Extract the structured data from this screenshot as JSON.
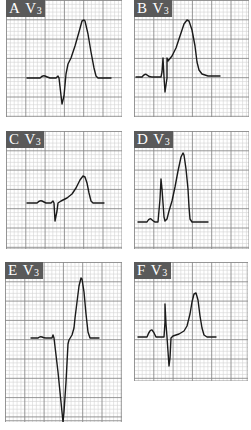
{
  "figure": {
    "colors": {
      "label_bg": "#5a5a5a",
      "label_text": "#ffffff",
      "grid_minor": "#d4d4d4",
      "grid_major": "#8a8a8a",
      "trace": "#1a1a1a"
    },
    "grid": {
      "minor_px": 3.86,
      "major_px": 19.3
    },
    "panels": [
      {
        "id": "A",
        "letter": "A",
        "lead": "V",
        "lead_sub": "3",
        "x": 6,
        "y": 0,
        "w": 116,
        "h": 117,
        "trace": "M 21 78 L 34 78 Q 37 75 39 76 Q 41 77 44 78 L 50 78 L 52 76 L 53 78 L 56 104 L 58 96 L 60 74 L 62 64 L 65 58 L 69 46 L 73 32 L 76 21 L 78 20 L 79 21 L 82 34 L 85 52 L 88 68 L 90 76 L 92 78 L 105 78"
      },
      {
        "id": "B",
        "letter": "B",
        "lead": "V",
        "lead_sub": "3",
        "x": 134,
        "y": 0,
        "w": 115,
        "h": 117,
        "trace": "M 2 77 L 8 77 Q 11 73 13 75 Q 15 77 18 77 L 27 77 L 28 72 L 29 58 L 30 77 L 31 92 L 33 78 L 33 58 L 34 61 L 38 56 L 42 48 L 46 36 L 50 24 L 53 20 L 55 21 L 58 30 L 61 46 L 63 62 L 65 70 L 68 74 L 74 76 L 86 76"
      },
      {
        "id": "C",
        "letter": "C",
        "lead": "V",
        "lead_sub": "3",
        "x": 6,
        "y": 131,
        "w": 116,
        "h": 118,
        "trace": "M 21 72 L 31 72 Q 34 69 36 70 Q 38 71 40 72 L 45 72 L 47 70 L 48 72 L 49 90 L 51 80 L 52 72 L 55 70 L 61 67 L 66 63 L 70 57 L 74 49 L 77 45 L 79 46 L 81 52 L 83 62 L 85 70 L 87 72 L 98 72"
      },
      {
        "id": "D",
        "letter": "D",
        "lead": "V",
        "lead_sub": "3",
        "x": 134,
        "y": 131,
        "w": 115,
        "h": 118,
        "trace": "M 4 91 L 13 91 Q 15 87 17 88 Q 19 90 21 91 L 24 91 L 26 68 L 27 48 L 28 58 L 30 86 L 31 90 L 33 88 L 35 80 L 38 70 L 41 56 L 44 40 L 47 26 L 49 22 L 50 24 L 52 38 L 54 58 L 55 76 L 56 88 L 58 91 L 74 91"
      },
      {
        "id": "E",
        "letter": "E",
        "lead": "V",
        "lead_sub": "3",
        "x": 5,
        "y": 262,
        "w": 117,
        "h": 160,
        "trace": "M 26 76 L 33 76 Q 35 74 37 75 Q 39 76 41 76 L 47 76 L 48 73 L 49 76 L 53 110 L 57 150 L 58 160 L 59 150 L 61 120 L 63 82 L 64 78 L 67 73 L 69 66 L 70 56 L 72 40 L 74 24 L 76 16 L 77 17 L 79 30 L 81 52 L 83 70 L 85 76 L 94 76"
      },
      {
        "id": "F",
        "letter": "F",
        "lead": "V",
        "lead_sub": "3",
        "x": 134,
        "y": 262,
        "w": 114,
        "h": 119,
        "trace": "M 4 75 L 13 75 Q 16 67 18 68 Q 20 70 22 75 L 30 75 L 31 60 L 31 42 L 32 62 L 33 75 L 35 104 L 36 96 L 37 76 L 39 74 L 45 72 L 50 69 L 53 64 L 56 52 L 58 40 L 60 32 L 62 31 L 64 38 L 66 54 L 68 66 L 70 73 L 73 75 L 82 75"
      }
    ]
  }
}
